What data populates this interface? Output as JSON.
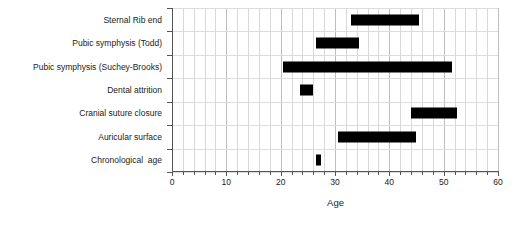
{
  "chart_data": {
    "type": "bar",
    "orientation": "horizontal",
    "subtype": "range-bar",
    "title": "",
    "xlabel": "Age",
    "ylabel": "",
    "xlim": [
      0,
      60
    ],
    "xticks": [
      0,
      10,
      20,
      30,
      40,
      50,
      60
    ],
    "xtick_labels": [
      "0",
      "10",
      "20",
      "30",
      "40",
      "50",
      "60"
    ],
    "x_minor_tick_step": 2,
    "grid": true,
    "grid_axis": "both",
    "legend": "none",
    "bar_color": "#000000",
    "categories": [
      "Sternal Rib end",
      "Pubic symphysis (Todd)",
      "Pubic symphysis (Suchey-Brooks)",
      "Dental attrition",
      "Cranial suture closure",
      "Auricular surface",
      "Chronological  age"
    ],
    "ranges": [
      {
        "category": "Sternal Rib end",
        "start": 33.0,
        "end": 45.5
      },
      {
        "category": "Pubic symphysis (Todd)",
        "start": 26.5,
        "end": 34.5
      },
      {
        "category": "Pubic symphysis (Suchey-Brooks)",
        "start": 20.5,
        "end": 51.5
      },
      {
        "category": "Dental attrition",
        "start": 23.5,
        "end": 26.0
      },
      {
        "category": "Cranial suture closure",
        "start": 44.0,
        "end": 52.5
      },
      {
        "category": "Auricular surface",
        "start": 30.5,
        "end": 45.0
      },
      {
        "category": "Chronological  age",
        "start": 26.5,
        "end": 27.5
      }
    ]
  },
  "axis": {
    "x_title": "Age"
  }
}
